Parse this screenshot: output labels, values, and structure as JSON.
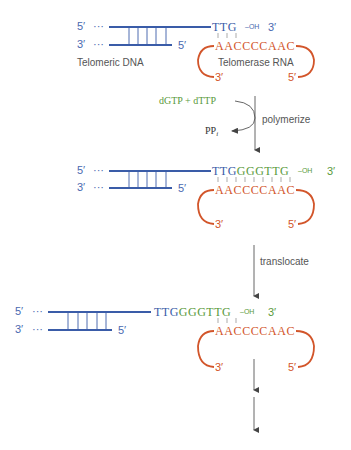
{
  "colors": {
    "dna": "#3a5ca8",
    "dna_text": "#4a69b0",
    "rna": "#d2552a",
    "new_nt": "#5a9a3c",
    "arrow": "#555555",
    "label": "#444444",
    "ppi": "#333333"
  },
  "panel1": {
    "dna_top_5": "5′",
    "dna_top_dots": "···",
    "dna_bottom_3": "3′",
    "dna_bottom_dots": "···",
    "dna_bottom_5": "5′",
    "overhang_seq": "TTG",
    "oh": "–OH",
    "overhang_3": "3′",
    "rna_seq": "AACCCCAAC",
    "rna_3": "3′",
    "rna_5": "5′",
    "dna_label": "Telomeric DNA",
    "rna_label": "Telomerase RNA"
  },
  "step1": {
    "substrates": "dGTP + dTTP",
    "byproduct": "PP",
    "byproduct_sub": "i",
    "label": "polymerize"
  },
  "panel2": {
    "dna_top_5": "5′",
    "dna_top_dots": "···",
    "dna_bottom_3": "3′",
    "dna_bottom_dots": "···",
    "dna_bottom_5": "5′",
    "overhang_old": "TTG",
    "overhang_new": "GGGTTG",
    "oh": "–OH",
    "overhang_3": "3′",
    "rna_seq": "AACCCCAAC",
    "rna_3": "3′",
    "rna_5": "5′"
  },
  "step2": {
    "label": "translocate"
  },
  "panel3": {
    "dna_top_5": "5′",
    "dna_top_dots": "···",
    "dna_bottom_3": "3′",
    "dna_bottom_dots": "···",
    "dna_bottom_5": "5′",
    "overhang_old": "TTG",
    "overhang_new": "GGGTTG",
    "oh": "–OH",
    "overhang_3": "3′",
    "rna_seq": "AACCCCAAC",
    "rna_3": "3′",
    "rna_5": "5′"
  }
}
